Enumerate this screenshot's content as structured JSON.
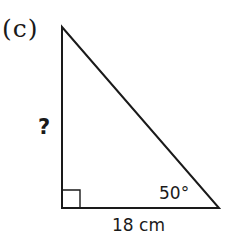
{
  "figure": {
    "part_label": "(c)",
    "shape": "right-triangle",
    "vertices": {
      "top": [
        62,
        27
      ],
      "right_angle": [
        62,
        208
      ],
      "bottom_right": [
        219,
        208
      ]
    },
    "labels": {
      "vertical_side": "?",
      "angle": "50°",
      "base": "18 cm"
    },
    "right_angle_marker": true,
    "colors": {
      "stroke": "#1a1a1a",
      "background": "#ffffff"
    }
  }
}
